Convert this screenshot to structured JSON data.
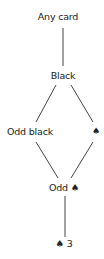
{
  "diagram": {
    "type": "hasse-diagram",
    "nodes": [
      {
        "id": "any",
        "label": "Any card",
        "x": 62,
        "y": 11
      },
      {
        "id": "black",
        "label": "Black",
        "x": 63,
        "y": 70
      },
      {
        "id": "odd-black",
        "label": "Odd black",
        "x": 30,
        "y": 126
      },
      {
        "id": "spade",
        "label": "♠",
        "x": 96,
        "y": 126
      },
      {
        "id": "odd-spade",
        "label": "Odd ♠",
        "x": 64,
        "y": 182
      },
      {
        "id": "spade-3",
        "label": "♠ 3",
        "x": 64,
        "y": 238
      }
    ],
    "edges": [
      {
        "from": "any",
        "to": "black"
      },
      {
        "from": "black",
        "to": "odd-black"
      },
      {
        "from": "black",
        "to": "spade"
      },
      {
        "from": "odd-black",
        "to": "odd-spade"
      },
      {
        "from": "spade",
        "to": "odd-spade"
      },
      {
        "from": "odd-spade",
        "to": "spade-3"
      }
    ],
    "line_color": "#444444",
    "text_color": "#222222"
  }
}
